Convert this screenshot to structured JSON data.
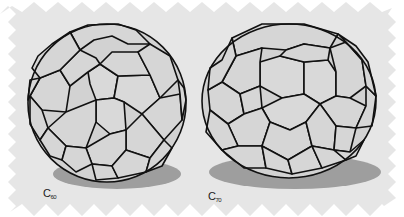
{
  "figure": {
    "background_color": "#e6e6e6",
    "border_style": "zigzag",
    "molecules": [
      {
        "name": "C60",
        "label_main": "C",
        "label_sub": "60",
        "shape": "truncated icosahedron (sphere)",
        "face_color": "#d4d4d4",
        "edge_color": "#111111",
        "shadow_color": "#9e9e9e"
      },
      {
        "name": "C70",
        "label_main": "C",
        "label_sub": "70",
        "shape": "elongated fullerene (ellipsoid)",
        "face_color": "#d4d4d4",
        "edge_color": "#111111",
        "shadow_color": "#9e9e9e"
      }
    ]
  }
}
